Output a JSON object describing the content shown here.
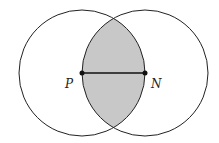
{
  "diagram": {
    "type": "two-overlapping-circles",
    "shaded_region": "intersection",
    "points": [
      {
        "label": "P",
        "x": 82,
        "y": 73
      },
      {
        "label": "N",
        "x": 145,
        "y": 73
      }
    ],
    "circles": [
      {
        "center": "P",
        "radius": 63
      },
      {
        "center": "N",
        "radius": 63
      }
    ],
    "segment": [
      "P",
      "N"
    ],
    "colors": {
      "stroke": "#222222",
      "shade": "#c8c8c8",
      "background": "#ffffff"
    }
  },
  "labels": {
    "p": "P",
    "n": "N"
  }
}
